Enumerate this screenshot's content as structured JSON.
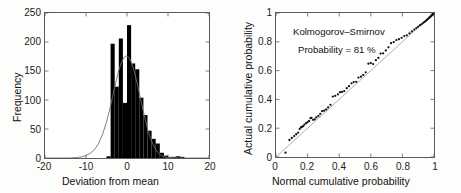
{
  "figure": {
    "panels": [
      "histogram-panel",
      "qq-panel"
    ],
    "background_color": "#fdfdfb",
    "axis_color": "#5a5a5a",
    "bar_color": "#000000",
    "curve_color": "#707070",
    "marker_color": "#111111"
  },
  "histogram": {
    "xlabel": "Deviation from mean",
    "ylabel": "Frequency",
    "xticks": [
      "-20",
      "-10",
      "0",
      "10",
      "20"
    ],
    "yticks": [
      "0",
      "50",
      "100",
      "150",
      "200",
      "250"
    ]
  },
  "qq": {
    "xlabel": "Normal cumulative probability",
    "ylabel": "Actual cumulative probability",
    "xticks": [
      "0",
      "0.2",
      "0.4",
      "0.6",
      "0.8",
      "1"
    ],
    "yticks": [
      "0",
      "0.2",
      "0.4",
      "0.6",
      "0.8",
      "1"
    ],
    "annotation_line1": "Kolmogorov–Smirnov",
    "annotation_line2": "Probability = 81 %"
  },
  "chart_data": [
    {
      "type": "bar",
      "title": "",
      "xlabel": "Deviation from mean",
      "ylabel": "Frequency",
      "xlim": [
        -20,
        20
      ],
      "ylim": [
        0,
        250
      ],
      "grid": false,
      "legend": "none",
      "bin_width": 1,
      "bin_centers": [
        -11.5,
        -10.5,
        -9.5,
        -8.5,
        -7.5,
        -6.5,
        -5.5,
        -4.5,
        -3.5,
        -2.5,
        -1.5,
        -0.5,
        0.5,
        1.5,
        2.5,
        3.5,
        4.5,
        5.5,
        6.5,
        7.5,
        8.5,
        9.5,
        10.5,
        11.5,
        12.5,
        13.5
      ],
      "values": [
        0,
        0,
        0,
        0,
        0,
        0,
        0,
        3,
        197,
        123,
        206,
        95,
        229,
        163,
        153,
        104,
        74,
        47,
        33,
        25,
        9,
        4,
        2,
        2,
        3,
        2
      ],
      "overlay": {
        "name": "fitted normal curve",
        "type": "line",
        "x": [
          -20,
          -16,
          -14,
          -12,
          -11,
          -10,
          -9,
          -8,
          -7,
          -6,
          -5,
          -4.5,
          -4,
          -3.5,
          -3,
          -2.5,
          -2,
          -1.5,
          -1,
          -0.5,
          0,
          0.5,
          1,
          1.5,
          2,
          2.5,
          3,
          3.5,
          4,
          4.5,
          5,
          5.5,
          6,
          6.5,
          7,
          7.5,
          8,
          9,
          10,
          12,
          14,
          16,
          20
        ],
        "y": [
          0,
          0,
          0,
          1,
          2,
          4,
          8,
          14,
          24,
          40,
          62,
          76,
          90,
          106,
          122,
          137,
          151,
          162,
          170,
          175,
          176,
          173,
          166,
          156,
          143,
          128,
          112,
          96,
          80,
          65,
          51,
          39,
          29,
          21,
          15,
          10,
          6,
          2,
          1,
          0,
          0,
          0,
          0
        ]
      }
    },
    {
      "type": "scatter",
      "title": "",
      "xlabel": "Normal cumulative probability",
      "ylabel": "Actual cumulative probability",
      "xlim": [
        0,
        1
      ],
      "ylim": [
        0,
        1
      ],
      "grid": false,
      "legend": "none",
      "annotations": [
        "Kolmogorov–Smirnov",
        "Probability = 81 %"
      ],
      "reference_line": {
        "name": "y = x",
        "x": [
          0,
          1
        ],
        "y": [
          0,
          1
        ]
      },
      "series": [
        {
          "name": "empirical vs normal CDF",
          "x": [
            0.06,
            0.085,
            0.1,
            0.115,
            0.128,
            0.14,
            0.15,
            0.158,
            0.165,
            0.172,
            0.18,
            0.19,
            0.2,
            0.21,
            0.218,
            0.225,
            0.235,
            0.245,
            0.255,
            0.268,
            0.28,
            0.292,
            0.305,
            0.318,
            0.33,
            0.345,
            0.36,
            0.375,
            0.392,
            0.405,
            0.418,
            0.432,
            0.448,
            0.462,
            0.478,
            0.492,
            0.508,
            0.522,
            0.538,
            0.552,
            0.568,
            0.585,
            0.6,
            0.615,
            0.632,
            0.648,
            0.662,
            0.678,
            0.695,
            0.712,
            0.728,
            0.745,
            0.762,
            0.778,
            0.795,
            0.812,
            0.828,
            0.845,
            0.86,
            0.875,
            0.888,
            0.9,
            0.912,
            0.922,
            0.932,
            0.94,
            0.948,
            0.955,
            0.961,
            0.967,
            0.972,
            0.977,
            0.981,
            0.985,
            0.988,
            0.991,
            0.993,
            0.995,
            0.997,
            0.998,
            1.0
          ],
          "y": [
            0.03,
            0.118,
            0.132,
            0.145,
            0.158,
            0.17,
            0.195,
            0.205,
            0.21,
            0.215,
            0.225,
            0.235,
            0.242,
            0.25,
            0.27,
            0.272,
            0.258,
            0.262,
            0.275,
            0.285,
            0.3,
            0.318,
            0.322,
            0.33,
            0.345,
            0.362,
            0.42,
            0.425,
            0.435,
            0.45,
            0.452,
            0.458,
            0.478,
            0.492,
            0.512,
            0.52,
            0.522,
            0.552,
            0.558,
            0.57,
            0.588,
            0.648,
            0.652,
            0.645,
            0.672,
            0.688,
            0.718,
            0.72,
            0.74,
            0.762,
            0.79,
            0.798,
            0.812,
            0.818,
            0.828,
            0.84,
            0.845,
            0.858,
            0.872,
            0.885,
            0.895,
            0.905,
            0.915,
            0.922,
            0.932,
            0.938,
            0.945,
            0.952,
            0.958,
            0.964,
            0.969,
            0.974,
            0.979,
            0.983,
            0.986,
            0.989,
            0.992,
            0.994,
            0.996,
            0.998,
            1.0
          ]
        }
      ]
    }
  ]
}
